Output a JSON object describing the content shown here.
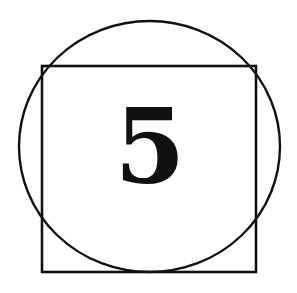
{
  "figure": {
    "width": 297,
    "height": 293,
    "background": "#ffffff",
    "stroke_color": "#111111",
    "label": "5",
    "shapes": [
      {
        "type": "circle",
        "cx": 149.5,
        "cy": 146.5,
        "rx": 130.5,
        "ry": 125.5
      },
      {
        "type": "square",
        "x": 42,
        "y": 66,
        "width": 214,
        "height": 206
      }
    ]
  }
}
